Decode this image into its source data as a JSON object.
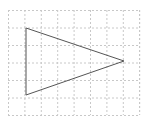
{
  "diagram": {
    "type": "grid-with-shape",
    "grid": {
      "x": 8,
      "y": 10,
      "width": 131,
      "height": 105,
      "spacing_x": 16.4,
      "spacing_y": 17.5,
      "color": "#c8c8c8",
      "dash": "2,2"
    },
    "shape": {
      "kind": "triangle",
      "points": [
        [
          26,
          28
        ],
        [
          26,
          95
        ],
        [
          124,
          61
        ]
      ],
      "stroke": "#555555",
      "stroke_width": 1,
      "fill": "none"
    }
  }
}
